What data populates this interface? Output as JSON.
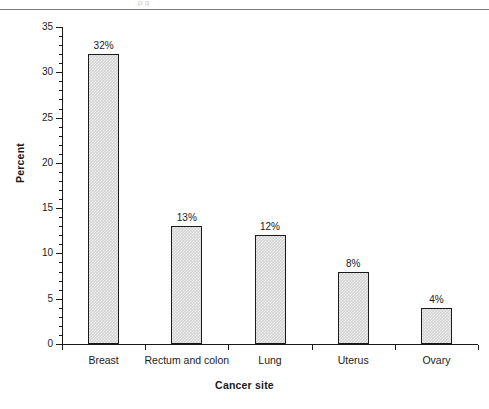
{
  "figure": {
    "top_fragment_text": "p    g",
    "y_axis_title": "Percent",
    "x_axis_title": "Cancer site"
  },
  "chart_data": {
    "type": "bar",
    "title": "",
    "subtitle": "",
    "xlabel": "Cancer site",
    "ylabel": "Percent",
    "categories": [
      "Breast",
      "Rectum and colon",
      "Lung",
      "Uterus",
      "Ovary"
    ],
    "values": [
      32,
      13,
      12,
      8,
      4
    ],
    "data_labels": [
      "32%",
      "13%",
      "12%",
      "8%",
      "4%"
    ],
    "ylim": [
      0,
      35
    ],
    "y_major_ticks": [
      0,
      5,
      10,
      15,
      20,
      25,
      30,
      35
    ],
    "y_major_tick_labels": [
      "0",
      "5",
      "10",
      "15",
      "20",
      "25",
      "30",
      "35"
    ],
    "y_minor_tick_interval": 1,
    "grid": false,
    "legend": false,
    "legend_position": "none",
    "bar_fill": "#d2d2d2",
    "bar_fill_pattern": "checkerboard",
    "bar_edge_color": "#1a1a1a",
    "background_color": "#ffffff"
  }
}
